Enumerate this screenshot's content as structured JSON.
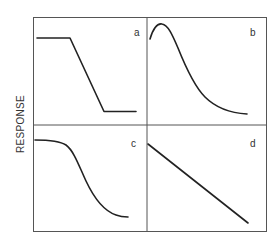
{
  "figure": {
    "y_axis_label": "RESPONSE",
    "x_axis_label": "",
    "layout": "2x2 grid of response curve panels",
    "panels": [
      {
        "id": "a",
        "label": "a",
        "shape": "plateau, linear decline, lower plateau"
      },
      {
        "id": "b",
        "label": "b",
        "shape": "initial rise to early peak, then sigmoidal decay"
      },
      {
        "id": "c",
        "label": "c",
        "shape": "high plateau then sigmoidal decline"
      },
      {
        "id": "d",
        "label": "d",
        "shape": "linear decline"
      }
    ]
  },
  "colors": {
    "frame": "#555555",
    "curve": "#222222",
    "text": "#333333",
    "background": "#ffffff"
  }
}
